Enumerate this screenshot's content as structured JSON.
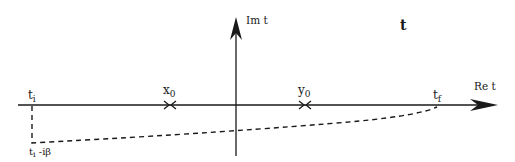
{
  "diagram": {
    "title": "t",
    "axes": {
      "real_label": "Re t",
      "imag_label": "Im t"
    },
    "points": {
      "t_i": {
        "base": "t",
        "sub": "i"
      },
      "x_0": {
        "base": "x",
        "sub": "0"
      },
      "y_0": {
        "base": "y",
        "sub": "0"
      },
      "t_f": {
        "base": "t",
        "sub": "f"
      },
      "t_i_minus_ibeta": {
        "base": "t",
        "sub": "i",
        "suffix": " -iβ"
      }
    },
    "contour": {
      "style": "dashed",
      "description": "Path from t_i down to t_i - iβ then curving back up to t_f"
    },
    "colors": {
      "ink": "#1a1a1a",
      "background": "#ffffff"
    }
  }
}
